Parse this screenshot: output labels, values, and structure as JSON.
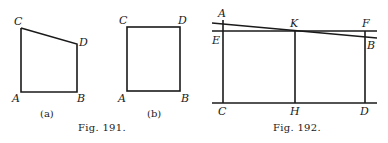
{
  "figures": [
    {
      "caption": "Fig. 191.",
      "panels": [
        {
          "sublabel": "(a)",
          "shape": "quadrilateral (trapezoid with slanted top)",
          "points": {
            "A": {
              "label": "A",
              "x": 21,
              "y": 92
            },
            "B": {
              "label": "B",
              "x": 77,
              "y": 92
            },
            "C": {
              "label": "C",
              "x": 21,
              "y": 28
            },
            "D": {
              "label": "D",
              "x": 77,
              "y": 44
            }
          }
        },
        {
          "sublabel": "(b)",
          "shape": "rectangle",
          "points": {
            "A": {
              "label": "A",
              "x": 127,
              "y": 91
            },
            "B": {
              "label": "B",
              "x": 180,
              "y": 91
            },
            "C": {
              "label": "C",
              "x": 127,
              "y": 27
            },
            "D": {
              "label": "D",
              "x": 180,
              "y": 27
            }
          }
        }
      ]
    },
    {
      "caption": "Fig. 192.",
      "labels": {
        "A": "A",
        "K": "K",
        "F": "F",
        "E": "E",
        "B": "B",
        "C": "C",
        "H": "H",
        "D": "D"
      },
      "lines": {
        "sloped_AB": {
          "x1": 212,
          "y1": 23,
          "x2": 377,
          "y2": 38
        },
        "horizontal_EF": {
          "x1": 212,
          "y1": 31,
          "x2": 377,
          "y2": 31
        },
        "base_CD": {
          "x1": 212,
          "y1": 103,
          "x2": 377,
          "y2": 103
        },
        "vertical_C": {
          "x": 223,
          "y1": 20,
          "y2": 103
        },
        "vertical_H": {
          "x": 295,
          "y1": 31,
          "y2": 103
        },
        "vertical_D": {
          "x": 365,
          "y1": 31,
          "y2": 103
        }
      }
    }
  ]
}
